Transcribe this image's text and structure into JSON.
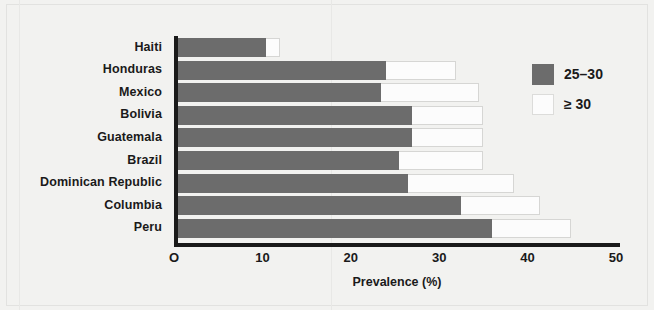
{
  "chart_data": {
    "type": "bar",
    "orientation": "horizontal",
    "stacked": true,
    "title": "",
    "subtitle": "",
    "xlabel": "Prevalence (%)",
    "ylabel": "",
    "xlim": [
      0,
      50
    ],
    "xticks": [
      0,
      10,
      20,
      30,
      40,
      50
    ],
    "xtick_labels": [
      "O",
      "10",
      "20",
      "30",
      "40",
      "50"
    ],
    "grid": false,
    "legend_position": "right",
    "categories": [
      "Haiti",
      "Honduras",
      "Mexico",
      "Bolivia",
      "Guatemala",
      "Brazil",
      "Dominican Republic",
      "Columbia",
      "Peru"
    ],
    "series": [
      {
        "name": "25–30",
        "color": "#6c6c6c",
        "values": [
          10,
          23.5,
          23,
          26.5,
          26.5,
          25,
          26,
          32,
          35.5
        ]
      },
      {
        "name": "≥ 30",
        "color": "#fcfcfc",
        "values": [
          1.5,
          8,
          11,
          8,
          8,
          9.5,
          12,
          9,
          9
        ]
      }
    ],
    "totals": [
      11.5,
      31.5,
      34,
      34.5,
      34.5,
      34.5,
      38,
      41,
      44.5
    ],
    "legend": [
      {
        "label": "25–30",
        "swatch": "dark"
      },
      {
        "label": "≥ 30",
        "swatch": "light"
      }
    ]
  },
  "colors": {
    "background": "#f2f2f0",
    "axis": "#1a1a1a",
    "series_25_30": "#6c6c6c",
    "series_ge_30": "#fcfcfc",
    "text": "#1a1a1a"
  }
}
